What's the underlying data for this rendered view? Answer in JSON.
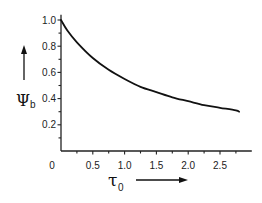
{
  "chart_data": {
    "type": "line",
    "title": "",
    "xlabel": "τ",
    "xlabel_subscript": "0",
    "ylabel": "Ψ",
    "ylabel_subscript": "b",
    "xlim": [
      0,
      3.0
    ],
    "ylim": [
      0,
      1.04
    ],
    "grid": false,
    "legend": null,
    "origin_label": "0",
    "x_ticks_major": [
      0.5,
      1.0,
      1.5,
      2.0,
      2.5
    ],
    "x_tick_labels": [
      "0.5",
      "1.0",
      "1.5",
      "2.0",
      "2.5"
    ],
    "x_ticks_minor": [
      0.25,
      0.75,
      1.25,
      1.75,
      2.25,
      2.75
    ],
    "y_ticks_major": [
      0.2,
      0.4,
      0.6,
      0.8,
      1.0
    ],
    "y_tick_labels": [
      "0.2",
      "0.4",
      "0.6",
      "0.8",
      "1.0"
    ],
    "y_ticks_minor": [
      0.1,
      0.3,
      0.5,
      0.7,
      0.9
    ],
    "series": [
      {
        "name": "Ψb(τ0)",
        "x": [
          0.0,
          0.1,
          0.25,
          0.5,
          0.75,
          1.0,
          1.25,
          1.5,
          1.75,
          2.0,
          2.25,
          2.5,
          2.75,
          2.8
        ],
        "y": [
          1.0,
          0.92,
          0.83,
          0.71,
          0.62,
          0.55,
          0.49,
          0.45,
          0.41,
          0.38,
          0.35,
          0.33,
          0.31,
          0.3
        ]
      }
    ]
  }
}
